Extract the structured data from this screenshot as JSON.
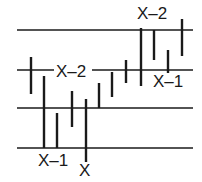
{
  "diagram": {
    "type": "price-bar-chart-sketch",
    "colors": {
      "background": "#ffffff",
      "line": "#1a1a1a",
      "text": "#1a1a1a"
    },
    "horizontal_lines": [
      {
        "y": 30,
        "x1": 17,
        "x2": 193
      },
      {
        "y": 70,
        "x1": 17,
        "x2": 193
      },
      {
        "y": 108,
        "x1": 17,
        "x2": 193
      },
      {
        "y": 148,
        "x1": 17,
        "x2": 193
      }
    ],
    "bars": [
      {
        "x": 31,
        "top": 57,
        "bottom": 94
      },
      {
        "x": 44,
        "top": 76,
        "bottom": 148
      },
      {
        "x": 57,
        "top": 113,
        "bottom": 148
      },
      {
        "x": 72,
        "top": 91,
        "bottom": 127
      },
      {
        "x": 86,
        "top": 99,
        "bottom": 162
      },
      {
        "x": 99,
        "top": 83,
        "bottom": 108
      },
      {
        "x": 112,
        "top": 72,
        "bottom": 97
      },
      {
        "x": 126,
        "top": 60,
        "bottom": 83
      },
      {
        "x": 141,
        "top": 28,
        "bottom": 86
      },
      {
        "x": 154,
        "top": 30,
        "bottom": 60
      },
      {
        "x": 168,
        "top": 50,
        "bottom": 73
      },
      {
        "x": 182,
        "top": 19,
        "bottom": 56
      }
    ],
    "labels": {
      "left_x_minus_2": {
        "text": "X–2",
        "x": 56,
        "y": 77
      },
      "bottom_x_minus_1": {
        "text": "X–1",
        "x": 38,
        "y": 166
      },
      "bottom_x": {
        "text": "X",
        "x": 79,
        "y": 176
      },
      "top_x_minus_2": {
        "text": "X–2",
        "x": 137,
        "y": 19
      },
      "right_x_minus_1": {
        "text": "X–1",
        "x": 153,
        "y": 87
      }
    }
  }
}
